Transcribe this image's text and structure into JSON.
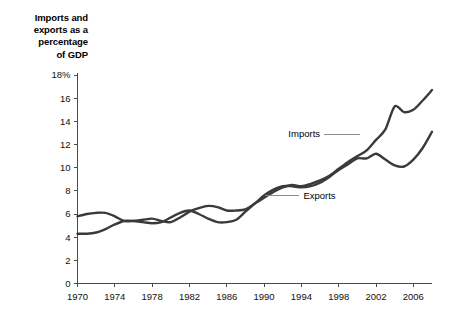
{
  "chart_data": {
    "type": "line",
    "title": "Imports and exports as a percentage of GDP",
    "title_lines": [
      "Imports and",
      "exports as a",
      "percentage",
      "of GDP"
    ],
    "xlabel": "",
    "ylabel": "Imports and exports as a percentage of GDP",
    "xlim": [
      1970,
      2008
    ],
    "ylim": [
      0,
      18
    ],
    "grid": false,
    "legend_position": "inline-annotations",
    "y_ticks": [
      0,
      2,
      4,
      6,
      8,
      10,
      12,
      14,
      16,
      18
    ],
    "y_tick_labels": [
      "0",
      "2",
      "4",
      "6",
      "8",
      "10",
      "12",
      "14",
      "16",
      "18%"
    ],
    "x_ticks": [
      1970,
      1974,
      1978,
      1982,
      1986,
      1990,
      1994,
      1998,
      2002,
      2006
    ],
    "x_tick_labels": [
      "1970",
      "1974",
      "1978",
      "1982",
      "1986",
      "1990",
      "1994",
      "1998",
      "2002",
      "2006"
    ],
    "x": [
      1970,
      1971,
      1972,
      1973,
      1974,
      1975,
      1976,
      1977,
      1978,
      1979,
      1980,
      1981,
      1982,
      1983,
      1984,
      1985,
      1986,
      1987,
      1988,
      1989,
      1990,
      1991,
      1992,
      1993,
      1994,
      1995,
      1996,
      1997,
      1998,
      1999,
      2000,
      2001,
      2002,
      2003,
      2004,
      2005,
      2006,
      2007,
      2008
    ],
    "series": [
      {
        "name": "Imports",
        "color": "#3a3a3a",
        "label_x": 1996,
        "label_y": 12.9,
        "values": [
          5.8,
          6.0,
          6.1,
          6.1,
          5.8,
          5.4,
          5.4,
          5.5,
          5.6,
          5.4,
          5.3,
          5.7,
          6.2,
          6.5,
          6.7,
          6.6,
          6.3,
          6.3,
          6.4,
          6.9,
          7.4,
          7.9,
          8.3,
          8.5,
          8.4,
          8.6,
          8.9,
          9.3,
          9.9,
          10.5,
          11.0,
          11.5,
          12.4,
          13.3,
          15.3,
          14.8,
          15.0,
          15.8,
          16.7
        ],
        "values_by_year": {
          "1970": 5.8,
          "1975": 5.4,
          "1980": 5.3,
          "1982": 6.2,
          "1985": 6.6,
          "1990": 7.4,
          "1993": 8.5,
          "1997": 9.3,
          "2000": 11.0,
          "2004": 15.3,
          "2005": 14.8,
          "2006": 15.0,
          "2008": 16.7
        }
      },
      {
        "name": "Exports",
        "color": "#3a3a3a",
        "label_x": 1994,
        "label_y": 7.6,
        "values": [
          4.3,
          4.3,
          4.4,
          4.7,
          5.1,
          5.4,
          5.4,
          5.3,
          5.2,
          5.3,
          5.7,
          6.1,
          6.3,
          6.0,
          5.6,
          5.3,
          5.3,
          5.5,
          6.2,
          6.9,
          7.6,
          8.1,
          8.4,
          8.4,
          8.3,
          8.4,
          8.7,
          9.2,
          9.8,
          10.3,
          10.8,
          10.8,
          11.2,
          10.7,
          10.2,
          10.1,
          10.7,
          11.7,
          13.1
        ],
        "values_by_year": {
          "1970": 4.3,
          "1975": 5.4,
          "1979": 5.3,
          "1982": 6.3,
          "1986": 5.3,
          "1990": 7.6,
          "1992": 8.4,
          "1997": 9.2,
          "2000": 10.8,
          "2002": 11.2,
          "2005": 10.1,
          "2008": 13.1
        }
      }
    ]
  },
  "annotations": {
    "imports_label": "Imports",
    "exports_label": "Exports"
  }
}
